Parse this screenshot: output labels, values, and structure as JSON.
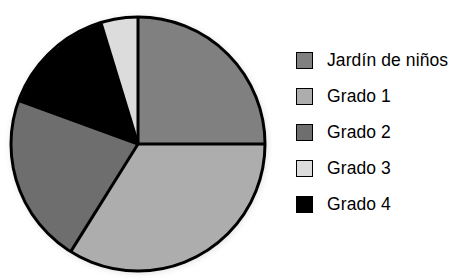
{
  "chart_data": {
    "type": "pie",
    "title": "",
    "xlabel": "",
    "ylabel": "",
    "grid": false,
    "legend_position": "right",
    "start_angle_deg": 0,
    "direction": "clockwise",
    "categories": [
      "Jardín de niños",
      "Grado 1",
      "Grado 2",
      "Grado 3",
      "Grado 4"
    ],
    "values": [
      25.0,
      33.9,
      21.7,
      4.7,
      14.7
    ],
    "angles_deg": [
      90,
      122,
      78,
      17,
      53
    ],
    "slice_boundaries_deg": [
      0,
      90,
      212,
      290,
      343,
      360
    ],
    "colors": [
      "#808080",
      "#adadad",
      "#6e6e6e",
      "#dcdcdc",
      "#000000"
    ],
    "slices": [
      {
        "label": "Jardín de niños",
        "value": 25.0,
        "angle_deg": 90,
        "start_deg": 0,
        "end_deg": 90,
        "color": "#808080"
      },
      {
        "label": "Grado 1",
        "value": 33.9,
        "angle_deg": 122,
        "start_deg": 90,
        "end_deg": 212,
        "color": "#adadad"
      },
      {
        "label": "Grado 2",
        "value": 21.7,
        "angle_deg": 78,
        "start_deg": 212,
        "end_deg": 290,
        "color": "#6e6e6e"
      },
      {
        "label": "Grado 4",
        "value": 14.7,
        "angle_deg": 53,
        "start_deg": 290,
        "end_deg": 343,
        "color": "#000000"
      },
      {
        "label": "Grado 3",
        "value": 4.7,
        "angle_deg": 17,
        "start_deg": 343,
        "end_deg": 360,
        "color": "#dcdcdc"
      }
    ]
  },
  "legend": {
    "items": [
      {
        "label": "Jardín de niños",
        "color": "#808080",
        "swatch_name": "legend-swatch-jardin-de-ninos"
      },
      {
        "label": "Grado 1",
        "color": "#adadad",
        "swatch_name": "legend-swatch-grado-1"
      },
      {
        "label": "Grado 2",
        "color": "#6e6e6e",
        "swatch_name": "legend-swatch-grado-2"
      },
      {
        "label": "Grado 3",
        "color": "#dcdcdc",
        "swatch_name": "legend-swatch-grado-3"
      },
      {
        "label": "Grado 4",
        "color": "#000000",
        "swatch_name": "legend-swatch-grado-4"
      }
    ]
  },
  "style": {
    "background": "#ffffff",
    "outline": "#000000",
    "separator": "#000000"
  }
}
